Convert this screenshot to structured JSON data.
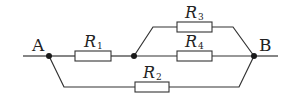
{
  "diagram": {
    "type": "circuit",
    "nodes": {
      "A": {
        "label": "A"
      },
      "B": {
        "label": "B"
      }
    },
    "resistors": [
      {
        "id": "R1",
        "symbol": "R",
        "subscript": "1"
      },
      {
        "id": "R2",
        "symbol": "R",
        "subscript": "2"
      },
      {
        "id": "R3",
        "symbol": "R",
        "subscript": "3"
      },
      {
        "id": "R4",
        "symbol": "R",
        "subscript": "4"
      }
    ],
    "topology": "R1 in series with (R3 parallel R4), that combination in parallel with R2, between A and B",
    "colors": {
      "wire": "#333333",
      "node": "#1a1a1a",
      "background": "#ffffff"
    }
  }
}
